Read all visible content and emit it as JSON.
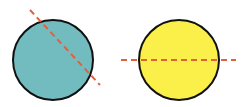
{
  "diagram": {
    "colors": {
      "left_fill": "#72bcc0",
      "right_fill": "#fbf04a",
      "stroke": "#111111",
      "dash": "#e0623a",
      "background": "#ffffff"
    },
    "shapes": [
      {
        "id": "left-circle",
        "cx": 53,
        "cy": 60,
        "r": 40,
        "fill": "#72bcc0"
      },
      {
        "id": "right-circle",
        "cx": 179,
        "cy": 60,
        "r": 40,
        "fill": "#fbf04a"
      }
    ],
    "lines": [
      {
        "id": "left-diagonal",
        "x1": 30,
        "y1": 10,
        "x2": 100,
        "y2": 85,
        "style": "dashed"
      },
      {
        "id": "right-horizontal",
        "x1": 121,
        "y1": 60,
        "x2": 236,
        "y2": 60,
        "style": "dashed"
      }
    ]
  }
}
